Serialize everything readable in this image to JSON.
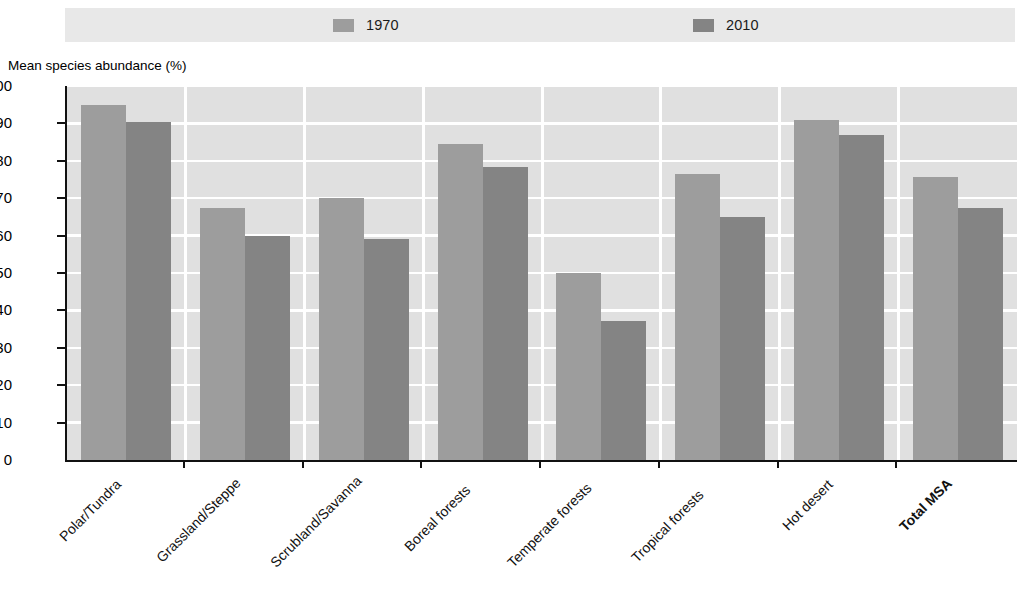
{
  "chart_data": {
    "type": "bar",
    "title": "",
    "xlabel": "",
    "ylabel": "Mean species abundance (%)",
    "ylim": [
      0,
      100
    ],
    "ytick_step": 10,
    "yticks": [
      100,
      90,
      80,
      70,
      60,
      50,
      40,
      30,
      20,
      10,
      0
    ],
    "grid": true,
    "legend_position": "top",
    "categories": [
      "Polar/Tundra",
      "Grassland/Steppe",
      "Scrubland/Savanna",
      "Boreal forests",
      "Temperate forests",
      "Tropical forests",
      "Hot desert",
      "Total MSA"
    ],
    "categories_bold": [
      false,
      false,
      false,
      false,
      false,
      false,
      false,
      true
    ],
    "series": [
      {
        "name": "1970",
        "color": "#9d9d9d",
        "values": [
          95.0,
          67.5,
          70.0,
          84.5,
          50.0,
          76.5,
          91.0,
          75.8
        ]
      },
      {
        "name": "2010",
        "color": "#848484",
        "values": [
          90.5,
          60.0,
          59.0,
          78.3,
          37.2,
          65.0,
          87.0,
          67.5
        ]
      }
    ]
  },
  "legend": {
    "items": [
      {
        "label": "1970",
        "color": "#9d9d9d",
        "swatch_name": "legend-swatch-1970"
      },
      {
        "label": "2010",
        "color": "#848484",
        "swatch_name": "legend-swatch-2010"
      }
    ],
    "band_color": "#e8e8e8"
  },
  "axis": {
    "y_title": "Mean species abundance (%)",
    "y_labels": [
      "100",
      "90",
      "80",
      "70",
      "60",
      "50",
      "40",
      "30",
      "20",
      "10",
      "0"
    ]
  },
  "colors": {
    "plot_background": "#e0e0e0",
    "gridline": "#ffffff",
    "axis_line": "#111111",
    "series_1970": "#9d9d9d",
    "series_2010": "#848484",
    "page_background": "#ffffff"
  }
}
